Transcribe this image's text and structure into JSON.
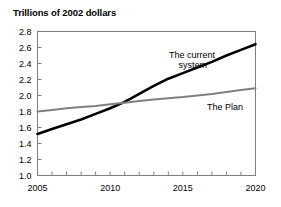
{
  "chart_data": {
    "type": "line",
    "title": "Trillions of 2002 dollars",
    "xlabel": "",
    "ylabel": "",
    "xlim": [
      2005,
      2020
    ],
    "ylim": [
      1.0,
      2.8
    ],
    "yticks": [
      "1.0",
      "1.2",
      "1.4",
      "1.6",
      "1.8",
      "2.0",
      "2.2",
      "2.4",
      "2.6",
      "2.8"
    ],
    "ytick_values": [
      1.0,
      1.2,
      1.4,
      1.6,
      1.8,
      2.0,
      2.2,
      2.4,
      2.6,
      2.8
    ],
    "xticks_labeled": [
      "2005",
      "2010",
      "2015",
      "2020"
    ],
    "xtick_values_all": [
      2005,
      2006,
      2007,
      2008,
      2009,
      2010,
      2011,
      2012,
      2013,
      2014,
      2015,
      2016,
      2017,
      2018,
      2019,
      2020
    ],
    "grid": false,
    "legend_position": "inline-annotation",
    "x": [
      2005,
      2006,
      2007,
      2008,
      2009,
      2010,
      2011,
      2012,
      2013,
      2014,
      2015,
      2016,
      2017,
      2018,
      2019,
      2020
    ],
    "series": [
      {
        "name": "The current system",
        "color": "#000000",
        "line_width": 2.6,
        "values": [
          1.52,
          1.58,
          1.64,
          1.7,
          1.77,
          1.84,
          1.92,
          2.02,
          2.12,
          2.21,
          2.28,
          2.35,
          2.42,
          2.5,
          2.57,
          2.64
        ],
        "label": "The current system",
        "label_lines": [
          "The current",
          "system"
        ]
      },
      {
        "name": "The Plan",
        "color": "#808080",
        "line_width": 2.0,
        "values": [
          1.8,
          1.82,
          1.84,
          1.855,
          1.87,
          1.89,
          1.91,
          1.93,
          1.95,
          1.965,
          1.98,
          2.0,
          2.02,
          2.045,
          2.07,
          2.09
        ],
        "label": "The Plan",
        "label_lines": [
          "The Plan"
        ]
      }
    ],
    "axis_color": "#808080",
    "background": "#ffffff"
  }
}
